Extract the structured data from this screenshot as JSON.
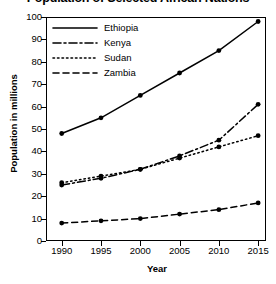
{
  "chart_data": {
    "type": "line",
    "title": "Population of Selected African Nations",
    "xlabel": "Year",
    "ylabel": "Population in millions",
    "categories": [
      "1990",
      "1995",
      "2000",
      "2005",
      "2010",
      "2015"
    ],
    "x": [
      1990,
      1995,
      2000,
      2005,
      2010,
      2015
    ],
    "xlim": [
      1988,
      2016
    ],
    "ylim": [
      0,
      100
    ],
    "xticks": [
      "1990",
      "1995",
      "2000",
      "2005",
      "2010",
      "2015"
    ],
    "yticks": [
      "0",
      "10",
      "20",
      "30",
      "40",
      "50",
      "60",
      "70",
      "80",
      "90",
      "100"
    ],
    "grid": false,
    "legend_position": "top-left",
    "markers": "filled-circle",
    "line_color": "#000000",
    "background_color": "#ffffff",
    "series": [
      {
        "name": "Ethiopia",
        "style": "solid",
        "dasharray": "",
        "values": [
          48,
          55,
          65,
          75,
          85,
          98
        ]
      },
      {
        "name": "Kenya",
        "style": "dash-dot",
        "dasharray": "8,3,2,3",
        "values": [
          25,
          28,
          32,
          38,
          45,
          61
        ]
      },
      {
        "name": "Sudan",
        "style": "dotted",
        "dasharray": "1.5,3",
        "values": [
          26,
          29,
          32,
          37,
          42,
          47
        ]
      },
      {
        "name": "Zambia",
        "style": "dashed",
        "dasharray": "6,4",
        "values": [
          8,
          9,
          10,
          12,
          14,
          17
        ]
      }
    ]
  }
}
